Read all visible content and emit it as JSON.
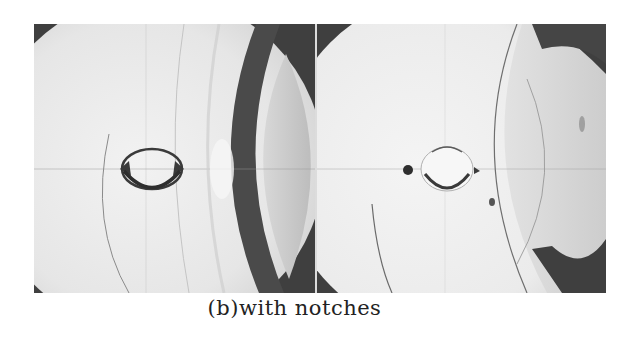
{
  "figure": {
    "caption": "(b)with notches",
    "panels": [
      {
        "id": "left",
        "description": "photoelastic / shadowgraph photo of disk with central hole and side notches, dark curved band at right"
      },
      {
        "id": "right",
        "description": "photoelastic / shadowgraph photo of disk with central hole, dark spot to left, curved fringe arcs"
      }
    ],
    "colors": {
      "background": "#ffffff",
      "dark_region": "#3f3f3f",
      "light_region": "#ececec",
      "caption_text": "#222222"
    }
  }
}
